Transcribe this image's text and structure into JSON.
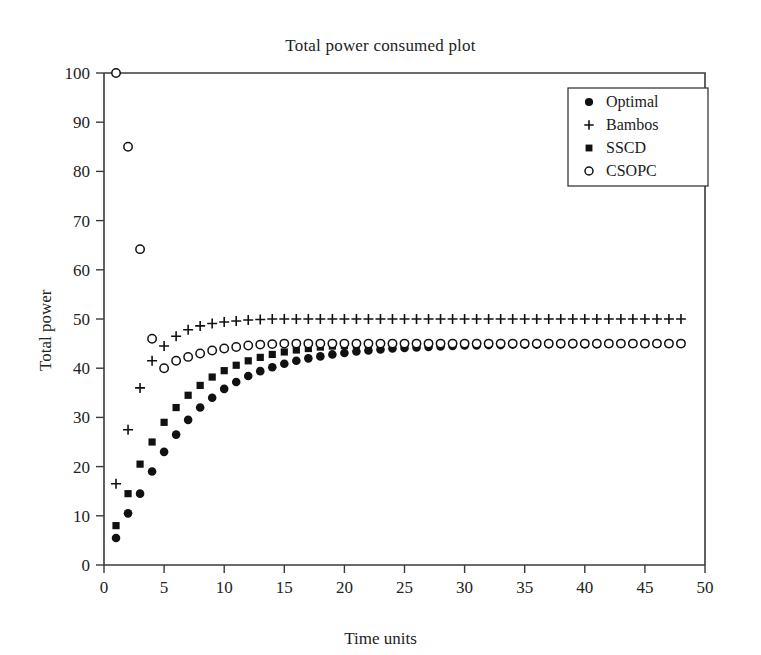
{
  "chart_data": {
    "type": "scatter",
    "title": "Total power consumed plot",
    "xlabel": "Time units",
    "ylabel": "Total power",
    "xlim": [
      0,
      50
    ],
    "ylim": [
      0,
      100
    ],
    "xticks": [
      0,
      5,
      10,
      15,
      20,
      25,
      30,
      35,
      40,
      45,
      50
    ],
    "yticks": [
      0,
      10,
      20,
      30,
      40,
      50,
      60,
      70,
      80,
      90,
      100
    ],
    "grid": false,
    "legend_position": "top-right",
    "x": [
      1,
      2,
      3,
      4,
      5,
      6,
      7,
      8,
      9,
      10,
      11,
      12,
      13,
      14,
      15,
      16,
      17,
      18,
      19,
      20,
      21,
      22,
      23,
      24,
      25,
      26,
      27,
      28,
      29,
      30,
      31,
      32,
      33,
      34,
      35,
      36,
      37,
      38,
      39,
      40,
      41,
      42,
      43,
      44,
      45,
      46,
      47,
      48
    ],
    "series": [
      {
        "name": "Optimal",
        "marker": "filled-circle",
        "color": "#111111",
        "values": [
          5.5,
          10.5,
          14.5,
          19.0,
          23.0,
          26.5,
          29.5,
          32.0,
          34.0,
          35.8,
          37.2,
          38.4,
          39.4,
          40.2,
          40.9,
          41.5,
          42.0,
          42.4,
          42.8,
          43.1,
          43.4,
          43.6,
          43.8,
          44.0,
          44.1,
          44.2,
          44.3,
          44.4,
          44.5,
          44.6,
          44.6,
          44.7,
          44.7,
          44.8,
          44.8,
          44.8,
          44.9,
          44.9,
          44.9,
          44.9,
          44.9,
          45.0,
          45.0,
          45.0,
          45.0,
          45.0,
          45.0,
          45.0
        ]
      },
      {
        "name": "Bambos",
        "marker": "plus",
        "color": "#111111",
        "values": [
          16.5,
          27.5,
          36.0,
          41.5,
          44.5,
          46.5,
          47.8,
          48.6,
          49.1,
          49.4,
          49.6,
          49.8,
          49.9,
          50.0,
          50.0,
          50.0,
          50.0,
          50.0,
          50.0,
          50.0,
          50.0,
          50.0,
          50.0,
          50.0,
          50.0,
          50.0,
          50.0,
          50.0,
          50.0,
          50.0,
          50.0,
          50.0,
          50.0,
          50.0,
          50.0,
          50.0,
          50.0,
          50.0,
          50.0,
          50.0,
          50.0,
          50.0,
          50.0,
          50.0,
          50.0,
          50.0,
          50.0,
          50.0
        ]
      },
      {
        "name": "SSCD",
        "marker": "filled-square",
        "color": "#111111",
        "values": [
          8.0,
          14.5,
          20.5,
          25.0,
          29.0,
          32.0,
          34.5,
          36.5,
          38.2,
          39.5,
          40.6,
          41.5,
          42.2,
          42.8,
          43.3,
          43.7,
          44.0,
          44.3,
          44.5,
          44.6,
          44.7,
          44.8,
          44.9,
          44.9,
          45.0,
          45.0,
          45.0,
          45.0,
          45.0,
          45.0,
          45.0,
          45.0,
          45.0,
          45.0,
          45.0,
          45.0,
          45.0,
          45.0,
          45.0,
          45.0,
          45.0,
          45.0,
          45.0,
          45.0,
          45.0,
          45.0,
          45.0,
          45.0
        ]
      },
      {
        "name": "CSOPC",
        "marker": "open-circle",
        "color": "#111111",
        "values": [
          100.0,
          85.0,
          64.2,
          46.0,
          40.0,
          41.5,
          42.3,
          43.0,
          43.6,
          44.0,
          44.3,
          44.6,
          44.8,
          44.9,
          45.0,
          45.0,
          45.0,
          45.0,
          45.0,
          45.0,
          45.0,
          45.0,
          45.0,
          45.0,
          45.0,
          45.0,
          45.0,
          45.0,
          45.0,
          45.0,
          45.0,
          45.0,
          45.0,
          45.0,
          45.0,
          45.0,
          45.0,
          45.0,
          45.0,
          45.0,
          45.0,
          45.0,
          45.0,
          45.0,
          45.0,
          45.0,
          45.0,
          45.0
        ]
      }
    ]
  },
  "figure": {
    "background_color": "#ffffff",
    "axis_color": "#3a3a3a",
    "text_color": "#222222"
  },
  "legend": {
    "items": [
      {
        "label": "Optimal",
        "marker": "filled-circle"
      },
      {
        "label": "Bambos",
        "marker": "plus"
      },
      {
        "label": "SSCD",
        "marker": "filled-square"
      },
      {
        "label": "CSOPC",
        "marker": "open-circle"
      }
    ]
  }
}
